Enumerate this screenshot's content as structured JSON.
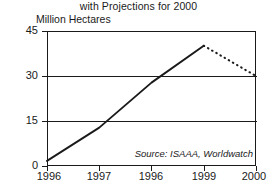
{
  "chart_data": {
    "type": "line",
    "title": "with Projections for 2000",
    "subtitle": "",
    "ylabel": "Million Hectares",
    "xlabel": "",
    "source": "Source: ISAAA, Worldwatch",
    "grid": true,
    "legend": "none",
    "xlim": [
      1996,
      2000
    ],
    "ylim": [
      0,
      45
    ],
    "yticks": [
      0,
      15,
      30,
      45
    ],
    "ytick_labels": [
      "0",
      "15",
      "30",
      "45"
    ],
    "xticks": [
      1996,
      1997,
      1998,
      1999,
      2000
    ],
    "xtick_labels": [
      "1996",
      "1997",
      "1996",
      "1999",
      "2000"
    ],
    "x": [
      1996,
      1997,
      1998,
      1999,
      2000
    ],
    "values": [
      1.7,
      12.8,
      27.8,
      40.1,
      30.0
    ],
    "series": [
      {
        "name": "Actual",
        "style": "solid",
        "x": [
          1996,
          1997,
          1998,
          1999
        ],
        "values": [
          1.7,
          12.8,
          27.8,
          40.1
        ]
      },
      {
        "name": "Projection",
        "style": "dotted",
        "x": [
          1999,
          2000
        ],
        "values": [
          40.1,
          30.0
        ]
      }
    ]
  },
  "chart": {
    "title": "with Projections for 2000",
    "unit_label": "Million Hectares",
    "source": "Source: ISAAA, Worldwatch",
    "y_labels": [
      "45",
      "30",
      "15",
      "0"
    ],
    "x_labels": [
      "1996",
      "1997",
      "1996",
      "1999",
      "2000"
    ]
  },
  "colors": {
    "ink": "#1a1a1a",
    "background": "#ffffff",
    "series_line": "#1a1a1a",
    "projection_line": "#1a1a1a"
  }
}
